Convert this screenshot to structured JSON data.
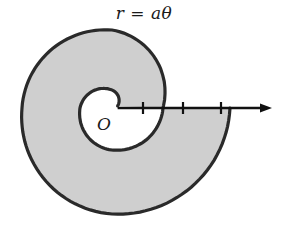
{
  "title": "r = aθ",
  "origin_label": "O",
  "colors": {
    "fill": "#cfcfcf",
    "stroke": "#2a2a2a",
    "background": "#ffffff"
  },
  "geometry": {
    "origin": [
      112,
      108
    ],
    "axis_end_x": 272,
    "tick_x": [
      143,
      183,
      221
    ],
    "tick_half_height": 6,
    "inner_spiral_samples_deg_r": [
      [
        20,
        6
      ],
      [
        90,
        18
      ],
      [
        180,
        32
      ],
      [
        270,
        42
      ],
      [
        360,
        51
      ]
    ],
    "outer_spiral_samples_deg_r": [
      [
        360,
        51
      ],
      [
        450,
        78
      ],
      [
        540,
        90
      ],
      [
        630,
        106
      ],
      [
        720,
        118
      ]
    ]
  }
}
